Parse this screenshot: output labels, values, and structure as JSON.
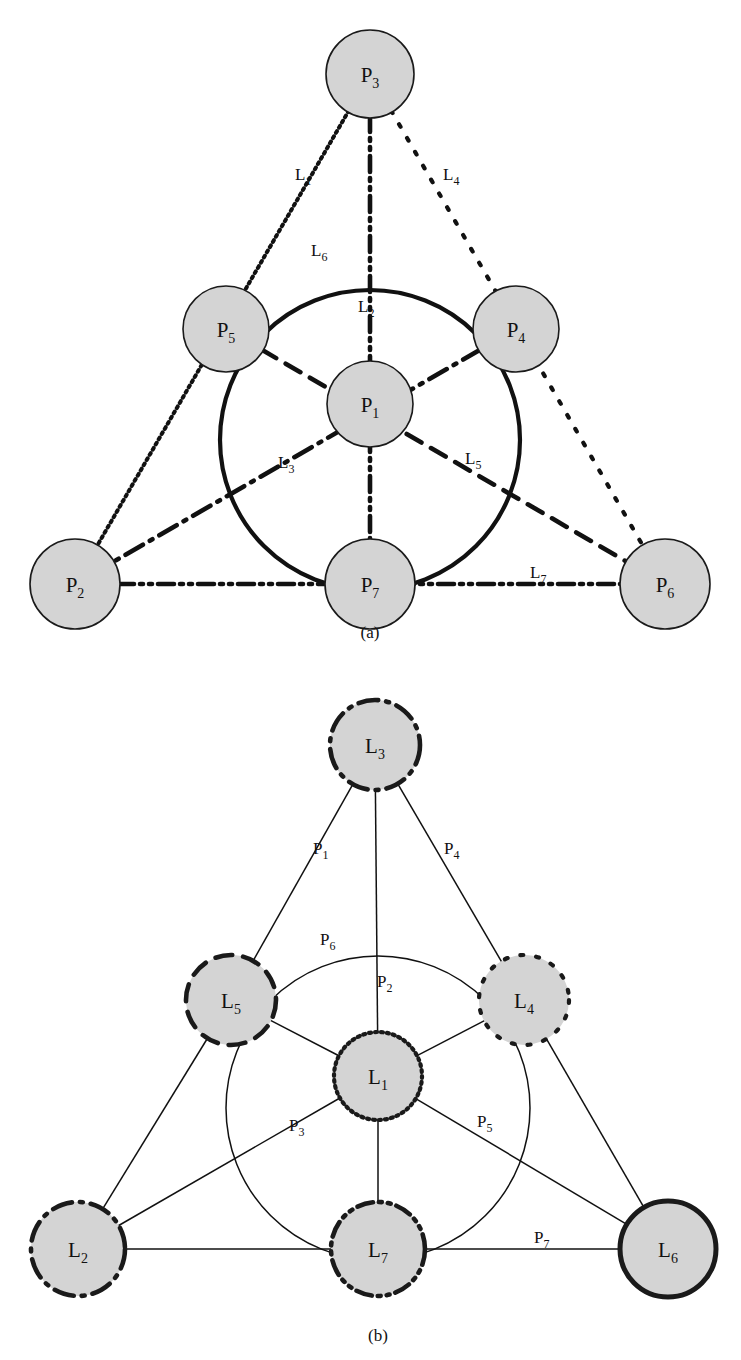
{
  "figure": {
    "panels": [
      {
        "id": "a",
        "caption": "(a)",
        "node_prefix": "P",
        "edge_prefix": "L"
      },
      {
        "id": "b",
        "caption": "(b)",
        "node_prefix": "L",
        "edge_prefix": "P"
      }
    ]
  },
  "style": {
    "node_fill": "#d4d4d4",
    "node_stroke": "#1a1a1a",
    "edge_stroke": "#111111",
    "background": "#ffffff"
  },
  "panel_a": {
    "caption": "(a)",
    "nodes": [
      {
        "name": "P1",
        "label": "P",
        "sub": "1",
        "x": 370,
        "y": 404,
        "r": 43,
        "border": "solid",
        "border_width": 1.6
      },
      {
        "name": "P2",
        "label": "P",
        "sub": "2",
        "x": 75,
        "y": 584,
        "r": 45,
        "border": "solid",
        "border_width": 1.6
      },
      {
        "name": "P3",
        "label": "P",
        "sub": "3",
        "x": 370,
        "y": 74,
        "r": 44,
        "border": "solid",
        "border_width": 1.6
      },
      {
        "name": "P4",
        "label": "P",
        "sub": "4",
        "x": 516,
        "y": 329,
        "r": 43,
        "border": "solid",
        "border_width": 1.6
      },
      {
        "name": "P5",
        "label": "P",
        "sub": "5",
        "x": 226,
        "y": 329,
        "r": 43,
        "border": "solid",
        "border_width": 1.6
      },
      {
        "name": "P6",
        "label": "P",
        "sub": "6",
        "x": 665,
        "y": 584,
        "r": 45,
        "border": "solid",
        "border_width": 1.6
      },
      {
        "name": "P7",
        "label": "P",
        "sub": "7",
        "x": 370,
        "y": 584,
        "r": 45,
        "border": "solid",
        "border_width": 1.6
      }
    ],
    "edges": [
      {
        "name": "L1",
        "label": "L",
        "sub": "1",
        "kind": "line",
        "from": "P3",
        "to": "P2",
        "style": "dotted-fine",
        "lx": 295,
        "ly": 180
      },
      {
        "name": "L2",
        "label": "L",
        "sub": "2",
        "kind": "line",
        "from": "P3",
        "to": "P7",
        "style": "dash-dot-dot",
        "lx": 358,
        "ly": 312
      },
      {
        "name": "L3",
        "label": "L",
        "sub": "3",
        "kind": "line",
        "from": "P4",
        "to": "P2",
        "style": "dash-dot",
        "lx": 278,
        "ly": 468
      },
      {
        "name": "L4",
        "label": "L",
        "sub": "4",
        "kind": "line",
        "from": "P3",
        "to": "P6",
        "style": "dotted-coarse",
        "lx": 443,
        "ly": 180
      },
      {
        "name": "L5",
        "label": "L",
        "sub": "5",
        "kind": "line",
        "from": "P5",
        "to": "P6",
        "style": "dashed",
        "lx": 465,
        "ly": 464
      },
      {
        "name": "L6",
        "label": "L",
        "sub": "6",
        "kind": "circle",
        "cx": 370,
        "cy": 440,
        "r": 150,
        "style": "solid",
        "lx": 311,
        "ly": 256
      },
      {
        "name": "L7",
        "label": "L",
        "sub": "7",
        "kind": "line",
        "from": "P2",
        "to": "P6",
        "style": "dash-dot-dot",
        "lx": 530,
        "ly": 578
      }
    ],
    "line_styles": {
      "dotted-fine": {
        "dasharray": "2 4",
        "width": 4.0
      },
      "dotted-coarse": {
        "dasharray": "3 13",
        "width": 4.2
      },
      "dashed": {
        "dasharray": "17 11",
        "width": 4.6
      },
      "dash-dot": {
        "dasharray": "20 8 3 8",
        "width": 4.6
      },
      "dash-dot-dot": {
        "dasharray": "16 6 3 6 3 6",
        "width": 4.6
      },
      "solid": {
        "dasharray": "none",
        "width": 4.2
      }
    }
  },
  "panel_b": {
    "caption": "(b)",
    "nodes": [
      {
        "name": "L1",
        "label": "L",
        "sub": "1",
        "x": 378,
        "y": 1076,
        "r": 44,
        "border": "dotted-fine",
        "border_width": 4.2
      },
      {
        "name": "L2",
        "label": "L",
        "sub": "2",
        "x": 78,
        "y": 1249,
        "r": 47,
        "border": "dash-dot",
        "border_width": 4.6
      },
      {
        "name": "L3",
        "label": "L",
        "sub": "3",
        "x": 375,
        "y": 745,
        "r": 45,
        "border": "dash-dot",
        "border_width": 4.6
      },
      {
        "name": "L4",
        "label": "L",
        "sub": "4",
        "x": 524,
        "y": 1000,
        "r": 45,
        "border": "dotted-coarse",
        "border_width": 4.2
      },
      {
        "name": "L5",
        "label": "L",
        "sub": "5",
        "x": 231,
        "y": 1000,
        "r": 45,
        "border": "dashed",
        "border_width": 4.6
      },
      {
        "name": "L6",
        "label": "L",
        "sub": "6",
        "x": 668,
        "y": 1249,
        "r": 48,
        "border": "solid",
        "border_width": 5.0
      },
      {
        "name": "L7",
        "label": "L",
        "sub": "7",
        "x": 378,
        "y": 1249,
        "r": 47,
        "border": "dash-dot-dot",
        "border_width": 4.6
      }
    ],
    "edges": [
      {
        "name": "P1",
        "label": "P",
        "sub": "1",
        "kind": "line",
        "from": "L3",
        "to": "L5",
        "lx": 313,
        "ly": 854
      },
      {
        "name": "P2",
        "label": "P",
        "sub": "2",
        "kind": "line",
        "from": "L3",
        "to": "L1",
        "lx": 377,
        "ly": 987
      },
      {
        "name": "P3",
        "label": "P",
        "sub": "3",
        "kind": "line",
        "from": "L1",
        "to": "L2",
        "lx": 289,
        "ly": 1131
      },
      {
        "name": "P4",
        "label": "P",
        "sub": "4",
        "kind": "line",
        "from": "L3",
        "to": "L4",
        "lx": 444,
        "ly": 854
      },
      {
        "name": "P5",
        "label": "P",
        "sub": "5",
        "kind": "line",
        "from": "L1",
        "to": "L6",
        "lx": 477,
        "ly": 1127
      },
      {
        "name": "P6",
        "label": "P",
        "sub": "6",
        "kind": "circle",
        "cx": 378,
        "cy": 1108,
        "r": 152,
        "lx": 320,
        "ly": 945
      },
      {
        "name": "P7",
        "label": "P",
        "sub": "7",
        "kind": "line",
        "from": "L7",
        "to": "L6",
        "lx": 534,
        "ly": 1243
      }
    ],
    "extra_edges": [
      {
        "name": "L5-L2",
        "from": "L5",
        "to": "L2"
      },
      {
        "name": "L5-L1",
        "from": "L5",
        "to": "L1"
      },
      {
        "name": "L4-L1",
        "from": "L4",
        "to": "L1"
      },
      {
        "name": "L4-L6",
        "from": "L4",
        "to": "L6"
      },
      {
        "name": "L2-L7",
        "from": "L2",
        "to": "L7"
      },
      {
        "name": "L1-L7",
        "from": "L1",
        "to": "L7"
      }
    ],
    "edge_stroke_width": 1.5
  }
}
